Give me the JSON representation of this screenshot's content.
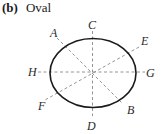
{
  "caption": {
    "tag": "(b)",
    "title": "Oval"
  },
  "diagram": {
    "oval": {
      "cx": 93,
      "cy": 73,
      "rx": 43,
      "ry": 34.5,
      "stroke": "#1a1a1a",
      "stroke_width": 1.6
    },
    "axis_style": {
      "stroke": "#888888",
      "dash": "3 2.5",
      "width": 0.9
    },
    "lines": [
      {
        "name": "C-D",
        "x1": 92.5,
        "y1": 31,
        "x2": 92.5,
        "y2": 116
      },
      {
        "name": "H-G",
        "x1": 38,
        "y1": 72,
        "x2": 145,
        "y2": 72
      },
      {
        "name": "A-B",
        "x1": 57,
        "y1": 38,
        "x2": 123,
        "y2": 104
      },
      {
        "name": "E-F",
        "x1": 139,
        "y1": 47,
        "x2": 45,
        "y2": 100
      }
    ],
    "labels": [
      {
        "text": "A",
        "x": 50,
        "y": 37
      },
      {
        "text": "C",
        "x": 88,
        "y": 29
      },
      {
        "text": "E",
        "x": 141,
        "y": 45
      },
      {
        "text": "H",
        "x": 28,
        "y": 76
      },
      {
        "text": "G",
        "x": 146,
        "y": 77
      },
      {
        "text": "F",
        "x": 38,
        "y": 110
      },
      {
        "text": "B",
        "x": 127,
        "y": 114
      },
      {
        "text": "D",
        "x": 87,
        "y": 130
      }
    ]
  }
}
